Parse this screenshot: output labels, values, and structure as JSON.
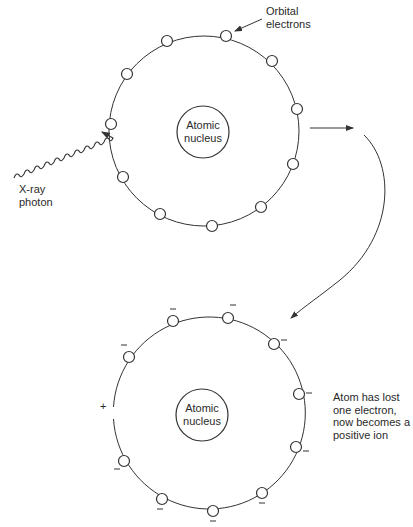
{
  "diagram": {
    "before": {
      "nucleus_label": [
        "Atomic",
        "nucleus"
      ],
      "electrons_label": [
        "Orbital",
        "electrons"
      ],
      "photon_label": [
        "X-ray",
        "photon"
      ],
      "electron_count": 11
    },
    "after": {
      "nucleus_label": [
        "Atomic",
        "nucleus"
      ],
      "charge_symbol": "+",
      "electron_charge_symbol": "−",
      "electron_count": 10,
      "caption": [
        "Atom has lost",
        "one electron,",
        "now becomes a",
        "positive ion"
      ]
    },
    "colors": {
      "line": "#333333",
      "background": "#ffffff"
    }
  }
}
